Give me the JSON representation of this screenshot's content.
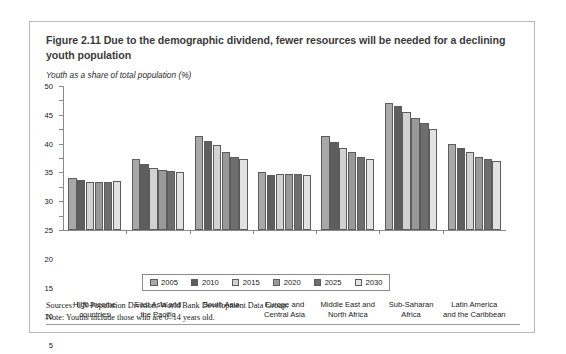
{
  "figure": {
    "title": "Figure 2.11  Due to the demographic dividend, fewer resources will be needed for a declining youth population",
    "axis_unit_label": "Youth as a share of total population (%)",
    "sources": "Sources: UN Population Division; World Bank Development Data Group.",
    "note": "Note: Youths include those who are 0–14 years old."
  },
  "colors": {
    "series_2005": "#a8a8a8",
    "series_2010": "#5e5e5e",
    "series_2015": "#d2d2d2",
    "series_2020": "#999999",
    "series_2025": "#6e6e6e",
    "series_2030": "#e2e2e2",
    "bar_outline": "#5c5c5c",
    "axis": "#8a8a8a",
    "card_border": "#b9b9b9"
  },
  "chart_data": {
    "type": "bar",
    "title": "Figure 2.11  Due to the demographic dividend, fewer resources will be needed for a declining youth population",
    "xlabel": "",
    "ylabel": "Youth as a share of total population (%)",
    "ylim": [
      0,
      50
    ],
    "yticks": [
      0,
      5,
      10,
      15,
      20,
      25,
      30,
      35,
      40,
      45,
      50
    ],
    "ytick_labels": [
      "0",
      "5",
      "10",
      "15",
      "20",
      "25",
      "30",
      "35",
      "40",
      "45",
      "50"
    ],
    "grid": false,
    "legend_position": "bottom",
    "categories": [
      "High-income\ncountries",
      "East Asia and\nthe Pacific",
      "South Asia",
      "Europe and\nCentral Asia",
      "Middle East and\nNorth Africa",
      "Sub-Saharan\nAfrica",
      "Latin America\nand the Caribbean"
    ],
    "series": [
      {
        "name": "2005",
        "values": [
          18.0,
          24.5,
          32.5,
          20.0,
          32.5,
          44.0,
          30.0
        ]
      },
      {
        "name": "2010",
        "values": [
          17.5,
          23.0,
          31.0,
          19.0,
          30.5,
          43.0,
          28.5
        ]
      },
      {
        "name": "2015",
        "values": [
          16.5,
          21.5,
          29.5,
          19.5,
          28.5,
          41.0,
          27.0
        ]
      },
      {
        "name": "2020",
        "values": [
          16.5,
          21.0,
          27.0,
          19.5,
          27.0,
          39.0,
          25.5
        ]
      },
      {
        "name": "2025",
        "values": [
          16.5,
          20.5,
          25.5,
          19.5,
          25.5,
          37.0,
          24.5
        ]
      },
      {
        "name": "2030",
        "values": [
          17.0,
          20.0,
          24.5,
          19.0,
          24.5,
          35.0,
          24.0
        ]
      }
    ]
  }
}
